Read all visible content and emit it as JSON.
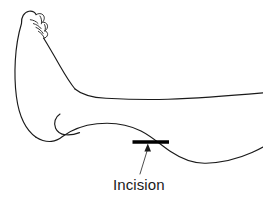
{
  "figure": {
    "background_color": "#ffffff",
    "line_color": "#1a1a1a",
    "marker_color": "#000000",
    "width": 263,
    "height": 203
  },
  "annotations": {
    "incision_label": "Incision",
    "incision_marker_name": "incision-marker-bar",
    "arrow_name": "incision-arrow"
  },
  "parts": {
    "toes": "toes-outline",
    "dorsum": "foot-dorsum-outline",
    "heel": "heel-outline",
    "sole": "sole-outline",
    "malleolus": "lateral-malleolus-mark",
    "shin": "anterior-leg-contour",
    "calf": "posterior-leg-contour"
  }
}
